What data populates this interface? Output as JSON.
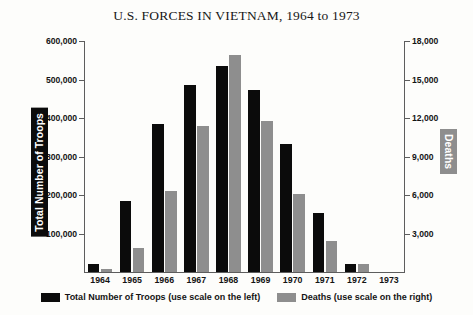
{
  "chart_data": {
    "type": "bar",
    "title": "U.S. FORCES IN VIETNAM, 1964 to 1973",
    "xlabel": "",
    "categories": [
      "1964",
      "1965",
      "1966",
      "1967",
      "1968",
      "1969",
      "1970",
      "1971",
      "1972",
      "1973"
    ],
    "grid": false,
    "legend_position": "bottom-center",
    "axes": {
      "left": {
        "label": "Total Number of Troops",
        "ylim": [
          0,
          600000
        ],
        "ticks": [
          100000,
          200000,
          300000,
          400000,
          500000,
          600000
        ],
        "tick_labels": [
          "100,000",
          "200,000",
          "300,000",
          "400,000",
          "500,000",
          "600,000"
        ],
        "label_text_color": "#ffffff",
        "label_bg_color": "#0b0b0b"
      },
      "right": {
        "label": "Deaths",
        "ylim": [
          0,
          18000
        ],
        "ticks": [
          3000,
          6000,
          9000,
          12000,
          15000,
          18000
        ],
        "tick_labels": [
          "3,000",
          "6,000",
          "9,000",
          "12,000",
          "15,000",
          "18,000"
        ],
        "label_text_color": "#ffffff",
        "label_bg_color": "#8e8e8e"
      }
    },
    "series": [
      {
        "name": "Total Number of Troops",
        "axis": "left",
        "color": "#0b0b0b",
        "legend_label": "Total Number of Troops (use scale on the left)",
        "values": [
          20000,
          184000,
          385000,
          485000,
          536000,
          474000,
          332000,
          153000,
          20000,
          0
        ]
      },
      {
        "name": "Deaths",
        "axis": "right",
        "color": "#8e8e8e",
        "legend_label": "Deaths (use scale on the right)",
        "values": [
          200,
          1900,
          6350,
          11400,
          16900,
          11800,
          6100,
          2400,
          600,
          0
        ]
      }
    ]
  }
}
